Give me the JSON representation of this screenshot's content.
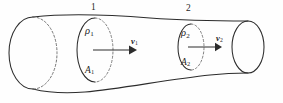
{
  "figure": {
    "name": "stream-tube-continuity-diagram",
    "caption": "",
    "background_color": "#fefefe",
    "line_color": "#2c2c2c",
    "hidden_line_color": "#7a7a7a"
  },
  "labels": {
    "section1_number": "1",
    "section2_number": "2",
    "density1": "ρ",
    "density1_sub": "1",
    "density2": "ρ",
    "density2_sub": "2",
    "area1": "A",
    "area1_sub": "1",
    "area2": "A",
    "area2_sub": "2",
    "velocity1": "v",
    "velocity1_sub": "1",
    "velocity2": "v",
    "velocity2_sub": "2"
  },
  "geometry": {
    "tube_type": "converging-stream-tube",
    "left_cap": {
      "center_x": 33,
      "center_y": 53,
      "rx": 24,
      "ry": 36,
      "front_solid": true,
      "back_dashed": true
    },
    "right_cap": {
      "center_x": 248,
      "center_y": 47,
      "rx": 16,
      "ry": 26,
      "front_solid": true,
      "back_solid": true
    },
    "section1": {
      "center_x": 95,
      "center_y": 50,
      "rx": 18,
      "ry": 32,
      "front_solid": true,
      "back_dashed": true
    },
    "section2": {
      "center_x": 191,
      "center_y": 47,
      "rx": 13,
      "ry": 23,
      "front_solid": true,
      "back_dashed": true
    },
    "arrow1": {
      "x_start": 93,
      "x_end": 133,
      "y": 50
    },
    "arrow2": {
      "x_start": 188,
      "x_end": 219,
      "y": 47
    }
  },
  "physics": {
    "relation": "continuity",
    "description": "mass flow rate equal at sections 1 and 2"
  }
}
